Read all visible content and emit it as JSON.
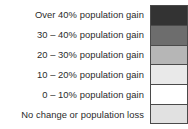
{
  "legend": {
    "title": "",
    "items": [
      {
        "label": "Over 40% population gain",
        "color": "#333333"
      },
      {
        "label": "30 – 40% population gain",
        "color": "#6d6d6d"
      },
      {
        "label": "20 – 30% population gain",
        "color": "#b6b6b6"
      },
      {
        "label": "10 – 20% population gain",
        "color": "#e9e9e9"
      },
      {
        "label": "0 – 10% population gain",
        "color": "#ffffff"
      },
      {
        "label": "No change or population loss",
        "color": "#e1e1e1"
      }
    ],
    "border_color": "#4a4a4a",
    "text_color": "#2b2b2b",
    "background_color": "#ffffff"
  }
}
